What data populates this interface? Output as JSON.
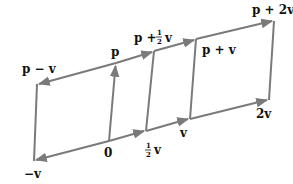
{
  "diagram": {
    "stroke_color": "#7a7a7a",
    "label_color": "#111111",
    "points": {
      "neg_v": {
        "x": 34,
        "y": 161
      },
      "zero": {
        "x": 109,
        "y": 141
      },
      "half_v": {
        "x": 146,
        "y": 131
      },
      "v": {
        "x": 190,
        "y": 119
      },
      "two_v": {
        "x": 269,
        "y": 100
      },
      "p_minus_v": {
        "x": 37,
        "y": 84
      },
      "p": {
        "x": 116,
        "y": 63
      },
      "p_plus_half_v": {
        "x": 154,
        "y": 51
      },
      "p_plus_v": {
        "x": 196,
        "y": 39
      },
      "p_plus_two_v": {
        "x": 274,
        "y": 21
      }
    },
    "labels": {
      "neg_v": "−v",
      "zero": "0",
      "half_v_frac_num": "1",
      "half_v_frac_den": "2",
      "half_v_var": "v",
      "v": "v",
      "two_v": "2v",
      "p_minus_v": "p − v",
      "p": "p",
      "p_plus_half_v_prefix": "p +",
      "p_plus_half_v_frac_num": "1",
      "p_plus_half_v_frac_den": "2",
      "p_plus_half_v_var": "v",
      "p_plus_v": "p + v",
      "p_plus_two_v": "p + 2v"
    }
  }
}
